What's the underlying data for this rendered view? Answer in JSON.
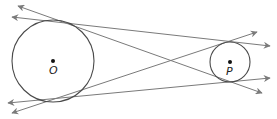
{
  "diagram": {
    "colors": {
      "circle": "#4a4a4a",
      "line": "#7a7a7a",
      "dot": "#111111",
      "label": "#222222"
    },
    "circles": [
      {
        "id": "O",
        "label": "O",
        "cx": 53,
        "cy": 61,
        "r": 41
      },
      {
        "id": "P",
        "label": "P",
        "cx": 230,
        "cy": 62,
        "r": 20
      }
    ],
    "tangent_lines": [
      {
        "id": "external-top",
        "x1": 270,
        "y1": 46,
        "x2": 12,
        "y2": 17,
        "arrows": "both"
      },
      {
        "id": "external-bottom",
        "x1": 270,
        "y1": 78,
        "x2": 8,
        "y2": 103,
        "arrows": "both"
      },
      {
        "id": "internal-1",
        "x1": 262,
        "y1": 93,
        "x2": 18,
        "y2": 6,
        "arrows": "both"
      },
      {
        "id": "internal-2",
        "x1": 257,
        "y1": 32,
        "x2": 12,
        "y2": 113,
        "arrows": "both"
      }
    ]
  }
}
